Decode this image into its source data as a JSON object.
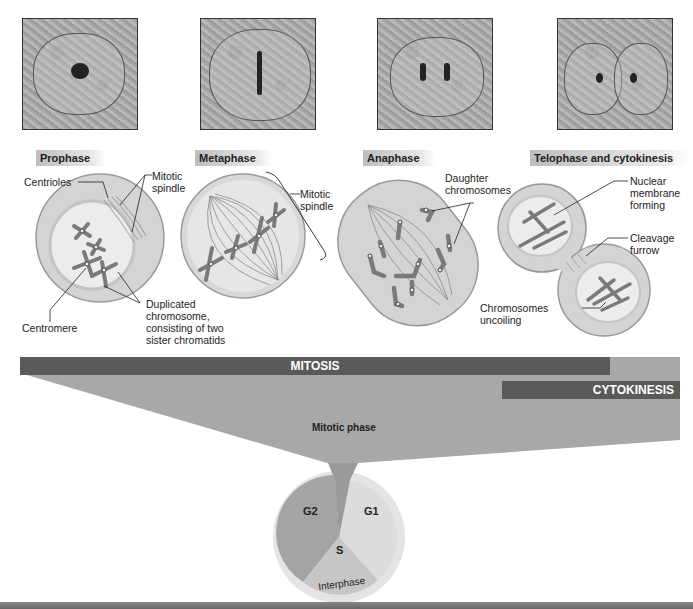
{
  "photos": [
    {
      "name": "prophase-micrograph"
    },
    {
      "name": "metaphase-micrograph"
    },
    {
      "name": "anaphase-micrograph"
    },
    {
      "name": "telophase-micrograph"
    }
  ],
  "phases": [
    {
      "label": "Prophase"
    },
    {
      "label": "Metaphase"
    },
    {
      "label": "Anaphase"
    },
    {
      "label": "Telophase and cytokinesis"
    }
  ],
  "annotations": {
    "centrioles": "Centrioles",
    "mitotic_spindle_1a": "Mitotic",
    "mitotic_spindle_1b": "spindle",
    "centromere": "Centromere",
    "dup_1": "Duplicated",
    "dup_2": "chromosome,",
    "dup_3": "consisting of two",
    "dup_4": "sister chromatids",
    "mitotic_spindle_2a": "Mitotic",
    "mitotic_spindle_2b": "spindle",
    "daughter_1": "Daughter",
    "daughter_2": "chromosomes",
    "nuclear_1": "Nuclear",
    "nuclear_2": "membrane",
    "nuclear_3": "forming",
    "cleavage_1": "Cleavage",
    "cleavage_2": "furrow",
    "uncoiling_1": "Chromosomes",
    "uncoiling_2": "uncoiling"
  },
  "bars": {
    "mitosis": "MITOSIS",
    "cytokinesis": "CYTOKINESIS",
    "mitotic_phase": "Mitotic phase"
  },
  "cell_cycle": {
    "segments": [
      {
        "label": "G2"
      },
      {
        "label": "G1"
      },
      {
        "label": "S"
      }
    ],
    "ring_label": "Interphase"
  },
  "colors": {
    "bar_dark": "#5a5a5a",
    "bar_light": "#a8a8a8",
    "cell_fill": "#d9d9d9",
    "chromosome": "#777777"
  }
}
